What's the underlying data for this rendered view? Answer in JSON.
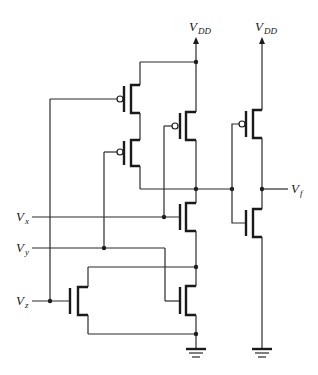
{
  "diagram": {
    "type": "CMOS logic gate schematic",
    "supply_labels": [
      {
        "main": "V",
        "sub": "DD"
      },
      {
        "main": "V",
        "sub": "DD"
      }
    ],
    "input_labels": [
      {
        "main": "V",
        "sub": "x"
      },
      {
        "main": "V",
        "sub": "y"
      },
      {
        "main": "V",
        "sub": "z"
      }
    ],
    "output_label": {
      "main": "V",
      "sub": "f"
    },
    "transistors": [
      {
        "id": "P1",
        "type": "PMOS",
        "gate": "Vz"
      },
      {
        "id": "P2",
        "type": "PMOS",
        "gate": "Vy"
      },
      {
        "id": "P3",
        "type": "PMOS",
        "gate": "Vx"
      },
      {
        "id": "N1",
        "type": "NMOS",
        "gate": "Vx"
      },
      {
        "id": "N2",
        "type": "NMOS",
        "gate": "Vy"
      },
      {
        "id": "N3",
        "type": "NMOS",
        "gate": "Vz"
      },
      {
        "id": "P4",
        "type": "PMOS",
        "role": "inverter pull-up"
      },
      {
        "id": "N4",
        "type": "NMOS",
        "role": "inverter pull-down"
      }
    ],
    "grounds": 2
  }
}
